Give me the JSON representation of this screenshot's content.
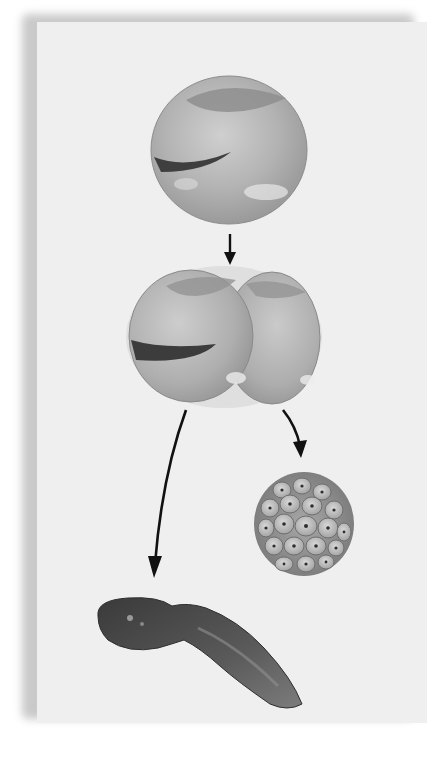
{
  "figure": {
    "background_color": "#efefef",
    "shadow_color": "#c9c9c9",
    "stages": [
      {
        "id": "egg",
        "label": "",
        "shape": "single-cell-sphere"
      },
      {
        "id": "two-cell",
        "label": "",
        "shape": "two-cell-embryo"
      },
      {
        "id": "tadpole",
        "label": "",
        "shape": "tadpole"
      },
      {
        "id": "blastula",
        "label": "",
        "shape": "cell-cluster-ball"
      }
    ],
    "arrows": [
      {
        "from": "egg",
        "to": "two-cell",
        "style": "straight-down"
      },
      {
        "from": "two-cell",
        "to": "tadpole",
        "style": "curved-left"
      },
      {
        "from": "two-cell",
        "to": "blastula",
        "style": "curved-right"
      }
    ]
  },
  "caption": ""
}
